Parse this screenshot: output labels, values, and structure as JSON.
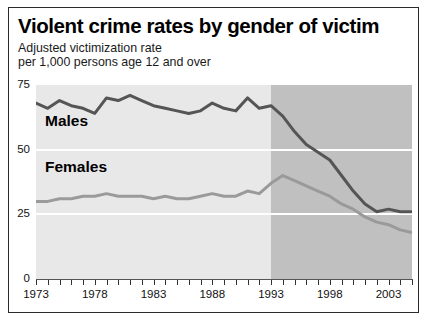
{
  "chart_data": {
    "type": "line",
    "title": "Violent crime rates by gender of victim",
    "subtitle_line1": "Adjusted victimization rate",
    "subtitle_line2": "per 1,000 persons age 12 and over",
    "xlabel": "",
    "ylabel": "",
    "xlim": [
      1973,
      2005
    ],
    "ylim": [
      0,
      75
    ],
    "yticks": [
      0,
      25,
      50,
      75
    ],
    "ytick_labels": [
      "0",
      "25",
      "50",
      "75"
    ],
    "xticks": [
      1973,
      1974,
      1975,
      1976,
      1977,
      1978,
      1979,
      1980,
      1981,
      1982,
      1983,
      1984,
      1985,
      1986,
      1987,
      1988,
      1989,
      1990,
      1991,
      1992,
      1993,
      1994,
      1995,
      1996,
      1997,
      1998,
      1999,
      2000,
      2001,
      2002,
      2003,
      2004,
      2005
    ],
    "xtick_labels": [
      "1973",
      "1978",
      "1983",
      "1988",
      "1993",
      "1998",
      "2003"
    ],
    "xtick_label_years": [
      1973,
      1978,
      1983,
      1988,
      1993,
      1998,
      2003
    ],
    "grid": "horizontal white gridlines at 25 and 50",
    "legend": "inline labels on plot",
    "plot_background": "#e8e8e8",
    "shaded_region": {
      "from": 1993,
      "to": 2005,
      "color": "#c0c0c0",
      "note": "darker shaded band covering 1993 to 2005"
    },
    "x": [
      1973,
      1974,
      1975,
      1976,
      1977,
      1978,
      1979,
      1980,
      1981,
      1982,
      1983,
      1984,
      1985,
      1986,
      1987,
      1988,
      1989,
      1990,
      1991,
      1992,
      1993,
      1994,
      1995,
      1996,
      1997,
      1998,
      1999,
      2000,
      2001,
      2002,
      2003,
      2004,
      2005
    ],
    "series": [
      {
        "name": "Males",
        "color": "#555555",
        "values": [
          68,
          66,
          69,
          67,
          66,
          64,
          70,
          69,
          71,
          69,
          67,
          66,
          65,
          64,
          65,
          68,
          66,
          65,
          70,
          66,
          67,
          63,
          57,
          52,
          49,
          46,
          40,
          34,
          29,
          26,
          27,
          26,
          26
        ]
      },
      {
        "name": "Females",
        "color": "#9a9a9a",
        "values": [
          30,
          30,
          31,
          31,
          32,
          32,
          33,
          32,
          32,
          32,
          31,
          32,
          31,
          31,
          32,
          33,
          32,
          32,
          34,
          33,
          37,
          40,
          38,
          36,
          34,
          32,
          29,
          27,
          24,
          22,
          21,
          19,
          18
        ]
      }
    ],
    "annotations": [
      {
        "text": "Males",
        "x": 1976,
        "y": 58
      },
      {
        "text": "Females",
        "x": 1976,
        "y": 42
      }
    ]
  }
}
